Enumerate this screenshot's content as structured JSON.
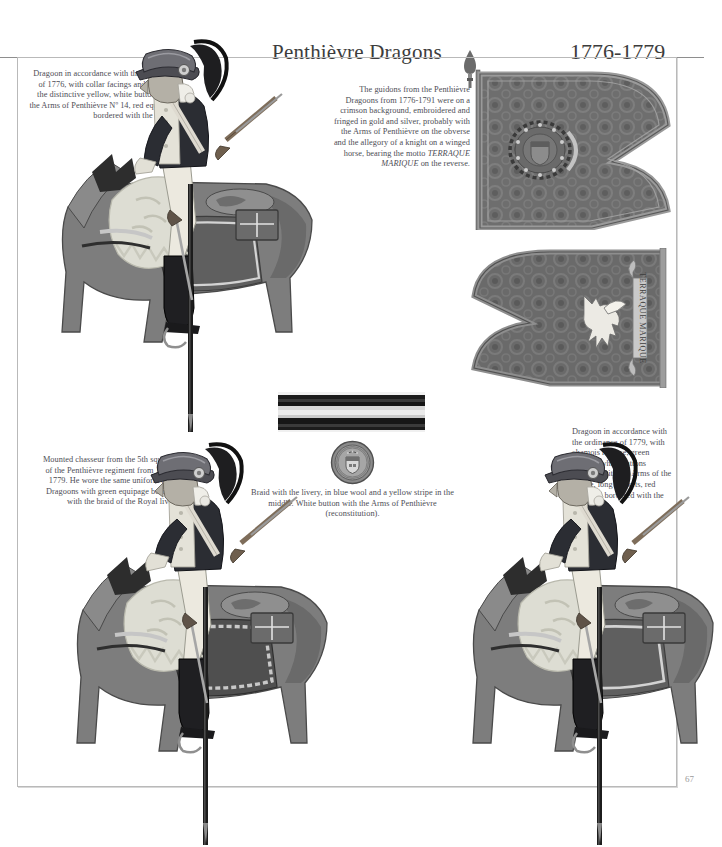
{
  "header": {
    "title": "Penthièvre Dragons",
    "dates": "1776-1779"
  },
  "captions": {
    "dragoon_1776": "Dragoon in accordance with the ordinance of 1776, with collar facings and lapels in the distinctive yellow, white buttons with the Arms of Penthièvre Nº 14, red equipage bordered with the livery.",
    "guidons": "The guidons from the Penthièvre Dragoons from 1776-1791 were on a crimson background, embroidered and fringed in gold and silver, probably with the Arms of Penthièvre on the obverse and the allegory of a knight on a winged horse, bearing the motto",
    "guidons_motto": "TERRAQUE MARIQUE",
    "guidons_end": "on the reverse.",
    "chasseur": "Mounted chasseur from the 5th squadron of the Penthièvre regiment from 1776 to 1779. He wore the same uniform as the Dragoons with green equipage bordered with the braid of the Royal livery.",
    "dragoon_1779": "Dragoon in accordance with the ordinance of 1779, with chamois reverse, green facings, white buttons stamped with the Arms of the Prince, long pockets, red equipage bordered with the livery.",
    "braid_button": "Braid with the livery, in blue wool and a yellow stripe in the middle. White button with the Arms of Penthièvre (reconstitution)."
  },
  "plates": {
    "braid_swatch_label": "livery-braid-swatch",
    "button_label": "penthievre-arms-button",
    "guidon_obverse_label": "guidon-obverse-arms-of-penthievre",
    "guidon_reverse_label": "guidon-reverse-winged-horse",
    "guidon_motto": "TERRAQUE MARIQUE"
  },
  "figures": {
    "dragoon_1776_label": "mounted-dragoon-1776",
    "chasseur_label": "mounted-chasseur-5th-squadron",
    "dragoon_1779_label": "mounted-dragoon-1779"
  },
  "footer": {
    "page_number": "67"
  },
  "colors": {
    "frame": "#b9b9b9",
    "text": "#4d4d55",
    "title": "#3c3c3c",
    "guidon_field": "#6e6e6e",
    "guidon_border": "#8d8d8d",
    "coat_dark": "#2b2d33",
    "waistcoat_light": "#e2e0d8",
    "horse_body": "#7a7a7a",
    "equipage": "#5d5d5d"
  }
}
